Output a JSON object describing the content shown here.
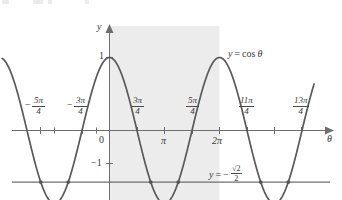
{
  "figure": {
    "title": "",
    "background_color": "#ffffff",
    "curve_color": "#595959",
    "axis_color": "#6e6e6e",
    "shade_color": "#ececec",
    "text_color": "#3a3a3a"
  },
  "axes": {
    "x_axis_label": "θ",
    "y_axis_label": "y",
    "origin_label": "0",
    "y_ticks": [
      {
        "label": "1",
        "value": 1
      },
      {
        "label": "−1",
        "value": -1
      }
    ],
    "x_ticks": [
      {
        "label": "",
        "value": -1.75,
        "kind": "plain"
      },
      {
        "label": "−5π/4",
        "numerator": "5π",
        "denominator": "4",
        "sign": "−",
        "value": -1.25,
        "kind": "fraction"
      },
      {
        "label": "",
        "value": -1.0,
        "kind": "plain"
      },
      {
        "label": "−3π/4",
        "numerator": "3π",
        "denominator": "4",
        "sign": "−",
        "value": -0.75,
        "kind": "fraction"
      },
      {
        "label": "0",
        "value": 0,
        "kind": "origin"
      },
      {
        "label": "3π/4",
        "numerator": "3π",
        "denominator": "4",
        "sign": "",
        "value": 0.75,
        "kind": "fraction"
      },
      {
        "label": "π",
        "value": 1.0,
        "kind": "plain-labeled"
      },
      {
        "label": "5π/4",
        "numerator": "5π",
        "denominator": "4",
        "sign": "",
        "value": 1.25,
        "kind": "fraction"
      },
      {
        "label": "2π",
        "value": 2.0,
        "kind": "plain-labeled"
      },
      {
        "label": "11π/4",
        "numerator": "11π",
        "denominator": "4",
        "sign": "",
        "value": 2.75,
        "kind": "fraction"
      },
      {
        "label": "",
        "value": 3.0,
        "kind": "plain"
      },
      {
        "label": "13π/4",
        "numerator": "13π",
        "denominator": "4",
        "sign": "",
        "value": 3.25,
        "kind": "fraction"
      }
    ]
  },
  "annotations": {
    "curve_label": {
      "lhs": "y",
      "eq": "=",
      "rhs": "cos",
      "var": "θ",
      "full": "y = cos θ"
    },
    "line_label": {
      "lhs": "y",
      "eq": "=",
      "sign": "−",
      "numerator": "√2",
      "denominator": "2",
      "full": "y = −√2/2"
    }
  },
  "chart_data": {
    "type": "line",
    "title": "",
    "xlabel": "θ",
    "ylabel": "y",
    "xlim": [
      -1.95,
      3.72
    ],
    "ylim": [
      -1.42,
      1.42
    ],
    "x_units": "pi",
    "grid": false,
    "legend": "inline-annotations",
    "shaded_region": {
      "x_start": 0,
      "x_end": 2,
      "color": "#ececec",
      "note": "one period highlighted from 0 to 2π"
    },
    "series": [
      {
        "name": "y = cos θ",
        "type": "line",
        "color": "#595959",
        "function": "cos(pi*x)",
        "amplitude": 1,
        "period": 2,
        "sample_points": [
          {
            "x": -1.95,
            "y": 0.988
          },
          {
            "x": -1.75,
            "y": 0.707
          },
          {
            "x": -1.5,
            "y": 0.0
          },
          {
            "x": -1.25,
            "y": -0.707
          },
          {
            "x": -1.0,
            "y": -1.0
          },
          {
            "x": -0.75,
            "y": -0.707
          },
          {
            "x": -0.5,
            "y": 0.0
          },
          {
            "x": -0.25,
            "y": 0.707
          },
          {
            "x": 0.0,
            "y": 1.0
          },
          {
            "x": 0.25,
            "y": 0.707
          },
          {
            "x": 0.5,
            "y": 0.0
          },
          {
            "x": 0.75,
            "y": -0.707
          },
          {
            "x": 1.0,
            "y": -1.0
          },
          {
            "x": 1.25,
            "y": -0.707
          },
          {
            "x": 1.5,
            "y": 0.0
          },
          {
            "x": 1.75,
            "y": 0.707
          },
          {
            "x": 2.0,
            "y": 1.0
          },
          {
            "x": 2.25,
            "y": 0.707
          },
          {
            "x": 2.5,
            "y": 0.0
          },
          {
            "x": 2.75,
            "y": -0.707
          },
          {
            "x": 3.0,
            "y": -1.0
          },
          {
            "x": 3.25,
            "y": -0.707
          },
          {
            "x": 3.5,
            "y": 0.0
          },
          {
            "x": 3.72,
            "y": 0.771
          }
        ]
      },
      {
        "name": "y = −√2/2",
        "type": "horizontal-line",
        "color": "#6e6e6e",
        "y_value": -0.7071
      }
    ],
    "intersections": [
      {
        "x": -1.25,
        "y": -0.7071
      },
      {
        "x": -0.75,
        "y": -0.7071
      },
      {
        "x": 0.75,
        "y": -0.7071
      },
      {
        "x": 1.25,
        "y": -0.7071
      },
      {
        "x": 2.75,
        "y": -0.7071
      },
      {
        "x": 3.25,
        "y": -0.7071
      }
    ]
  }
}
